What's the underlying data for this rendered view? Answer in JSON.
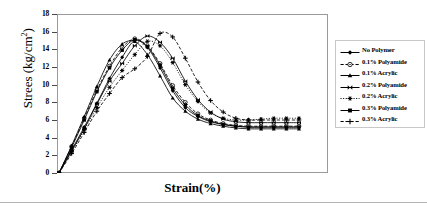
{
  "axes": {
    "y_title_main": "Strees (kg/cm",
    "y_title_sup": "2",
    "y_title_close": ")",
    "y_title_full": "Strees (kg/cm2)",
    "x_title": "Strain(%)",
    "y_ticks": [
      "0",
      "2",
      "4",
      "6",
      "8",
      "10",
      "12",
      "14",
      "16",
      "18"
    ]
  },
  "legend": {
    "items": [
      {
        "label": "No Polymer",
        "marker": "filled-diamond",
        "dash": "solid"
      },
      {
        "label": "0.1% Polyamide",
        "marker": "open-circle",
        "dash": "dashed"
      },
      {
        "label": "0.1% Acrylic",
        "marker": "filled-triangle",
        "dash": "solid"
      },
      {
        "label": "0.2% Polyamide",
        "marker": "bowtie-x",
        "dash": "solid"
      },
      {
        "label": "0.2% Acrylic",
        "marker": "star-asterisk",
        "dash": "dotted"
      },
      {
        "label": "0.3% Polyamide",
        "marker": "filled-square",
        "dash": "solid"
      },
      {
        "label": "0.3% Acrylic",
        "marker": "plus",
        "dash": "dashed"
      }
    ]
  },
  "chart_data": {
    "type": "line",
    "title": "",
    "xlabel": "Strain(%)",
    "ylabel": "Strees (kg/cm2)",
    "ylim": [
      0,
      18
    ],
    "xlim": [
      0,
      20
    ],
    "ytick_values": [
      0,
      2,
      4,
      6,
      8,
      10,
      12,
      14,
      16,
      18
    ],
    "xtick_values": [],
    "grid": false,
    "legend_position": "right",
    "x": [
      0,
      1,
      2,
      3,
      4,
      5,
      6,
      7,
      8,
      9,
      10,
      11,
      12,
      13,
      14,
      15,
      16,
      17,
      18,
      19
    ],
    "series": [
      {
        "name": "No Polymer",
        "marker": "filled-diamond",
        "dash": "solid",
        "values": [
          0,
          2.6,
          5.2,
          7.9,
          10.7,
          13.1,
          15.0,
          14.2,
          11.9,
          9.3,
          7.4,
          6.4,
          5.8,
          5.5,
          5.3,
          5.2,
          5.2,
          5.2,
          5.2,
          5.2
        ]
      },
      {
        "name": "0.1% Polyamide",
        "marker": "open-circle",
        "dash": "dashed",
        "values": [
          0,
          3.0,
          6.2,
          9.4,
          12.1,
          14.2,
          15.2,
          14.4,
          12.4,
          9.9,
          8.0,
          6.7,
          6.0,
          5.6,
          5.4,
          5.3,
          5.3,
          5.3,
          5.3,
          5.3
        ]
      },
      {
        "name": "0.1% Acrylic",
        "marker": "filled-triangle",
        "dash": "solid",
        "values": [
          0,
          3.1,
          6.4,
          9.8,
          12.8,
          14.6,
          14.9,
          13.4,
          11.0,
          8.5,
          7.0,
          6.1,
          5.6,
          5.3,
          5.1,
          5.0,
          5.0,
          5.0,
          5.0,
          5.0
        ]
      },
      {
        "name": "0.2% Polyamide",
        "marker": "bowtie-x",
        "dash": "solid",
        "values": [
          0,
          2.5,
          5.0,
          7.8,
          10.4,
          12.4,
          14.4,
          15.5,
          14.8,
          13.0,
          10.4,
          8.3,
          6.9,
          6.1,
          5.8,
          5.7,
          5.7,
          5.7,
          5.7,
          5.7
        ]
      },
      {
        "name": "0.2% Acrylic",
        "marker": "star-asterisk",
        "dash": "dotted",
        "values": [
          0,
          2.4,
          4.9,
          7.4,
          9.7,
          11.6,
          13.4,
          14.9,
          14.4,
          12.5,
          10.0,
          8.1,
          6.8,
          6.2,
          6.0,
          6.0,
          6.1,
          6.2,
          6.2,
          6.2
        ]
      },
      {
        "name": "0.3% Polyamide",
        "marker": "filled-square",
        "dash": "solid",
        "values": [
          0,
          2.9,
          6.0,
          9.2,
          11.9,
          13.9,
          15.1,
          14.3,
          12.2,
          9.6,
          7.7,
          6.5,
          5.9,
          5.5,
          5.3,
          5.2,
          5.2,
          5.2,
          5.2,
          5.2
        ]
      },
      {
        "name": "0.3% Acrylic",
        "marker": "plus",
        "dash": "dashed",
        "values": [
          0,
          2.2,
          4.6,
          7.0,
          9.0,
          10.8,
          11.8,
          13.2,
          15.8,
          15.4,
          13.0,
          10.3,
          8.2,
          6.9,
          6.2,
          6.0,
          6.0,
          6.0,
          6.0,
          6.0
        ]
      }
    ]
  }
}
